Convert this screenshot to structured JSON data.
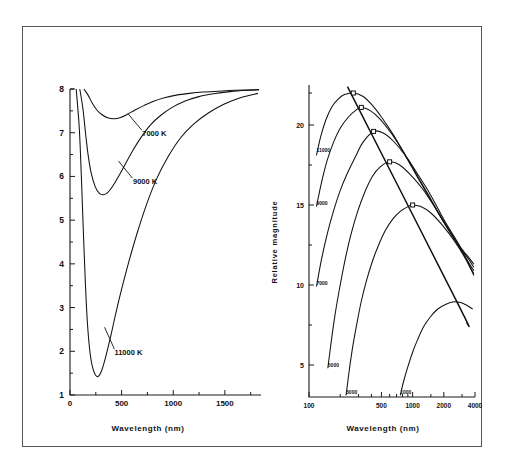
{
  "figure": {
    "border_color": "#555555",
    "background": "#ffffff"
  },
  "chart_data": [
    {
      "panel": "left",
      "type": "line",
      "title": "",
      "xlabel": "Wavelength (nm)",
      "ylabel": "",
      "xlim": [
        0,
        1850
      ],
      "ylim": [
        8,
        1
      ],
      "y_inverted": true,
      "x_scale": "linear",
      "y_scale": "linear",
      "grid": false,
      "xticks": [
        0,
        500,
        1000,
        1500
      ],
      "xtick_labels": [
        "0",
        "500",
        "1000",
        "1500"
      ],
      "x_minor_ticks": [
        250,
        750,
        1250,
        1750
      ],
      "yticks": [
        1,
        2,
        3,
        4,
        5,
        6,
        7,
        8
      ],
      "ytick_labels": [
        "1",
        "2",
        "3",
        "4",
        "5",
        "6",
        "7",
        "8"
      ],
      "y_minor_ticks": [
        1.5,
        2.5,
        3.5,
        4.5,
        5.5,
        6.5,
        7.5
      ],
      "legend_position": "inline-annotations",
      "series": [
        {
          "name": "11000 K",
          "label": "11000 K",
          "temperature_k": 11000,
          "peak_wavelength_nm": 264,
          "peak_magnitude": 1.42,
          "label_xy": [
            430,
            1.92
          ],
          "leader_from": [
            430,
            2.05
          ],
          "leader_to": [
            335,
            2.55
          ],
          "points": [
            [
              60,
              8.0
            ],
            [
              90,
              7.1
            ],
            [
              110,
              6.0
            ],
            [
              130,
              4.7
            ],
            [
              150,
              3.5
            ],
            [
              170,
              2.6
            ],
            [
              195,
              1.95
            ],
            [
              225,
              1.58
            ],
            [
              264,
              1.42
            ],
            [
              300,
              1.52
            ],
            [
              340,
              1.82
            ],
            [
              390,
              2.3
            ],
            [
              440,
              2.83
            ],
            [
              500,
              3.42
            ],
            [
              570,
              4.05
            ],
            [
              650,
              4.7
            ],
            [
              740,
              5.35
            ],
            [
              840,
              5.95
            ],
            [
              950,
              6.45
            ],
            [
              1070,
              6.88
            ],
            [
              1200,
              7.2
            ],
            [
              1340,
              7.45
            ],
            [
              1490,
              7.65
            ],
            [
              1650,
              7.8
            ],
            [
              1820,
              7.9
            ]
          ]
        },
        {
          "name": "9000 K",
          "label": "9000 K",
          "temperature_k": 9000,
          "peak_wavelength_nm": 322,
          "peak_magnitude": 5.58,
          "label_xy": [
            610,
            5.82
          ],
          "leader_from": [
            605,
            5.96
          ],
          "leader_to": [
            470,
            6.35
          ],
          "points": [
            [
              95,
              8.0
            ],
            [
              125,
              7.55
            ],
            [
              150,
              7.0
            ],
            [
              175,
              6.5
            ],
            [
              205,
              6.08
            ],
            [
              245,
              5.76
            ],
            [
              285,
              5.61
            ],
            [
              322,
              5.58
            ],
            [
              365,
              5.63
            ],
            [
              415,
              5.78
            ],
            [
              470,
              6.0
            ],
            [
              535,
              6.28
            ],
            [
              610,
              6.6
            ],
            [
              690,
              6.9
            ],
            [
              780,
              7.18
            ],
            [
              880,
              7.4
            ],
            [
              990,
              7.58
            ],
            [
              1110,
              7.72
            ],
            [
              1240,
              7.82
            ],
            [
              1390,
              7.89
            ],
            [
              1550,
              7.94
            ],
            [
              1720,
              7.97
            ],
            [
              1830,
              7.98
            ]
          ]
        },
        {
          "name": "7000 K",
          "label": "7000 K",
          "temperature_k": 7000,
          "peak_wavelength_nm": 428,
          "peak_magnitude": 7.32,
          "label_xy": [
            700,
            6.92
          ],
          "leader_from": [
            695,
            7.06
          ],
          "leader_to": [
            560,
            7.44
          ],
          "points": [
            [
              135,
              8.0
            ],
            [
              175,
              7.86
            ],
            [
              215,
              7.68
            ],
            [
              260,
              7.52
            ],
            [
              310,
              7.41
            ],
            [
              365,
              7.34
            ],
            [
              428,
              7.32
            ],
            [
              490,
              7.35
            ],
            [
              555,
              7.42
            ],
            [
              630,
              7.52
            ],
            [
              715,
              7.62
            ],
            [
              810,
              7.72
            ],
            [
              915,
              7.8
            ],
            [
              1030,
              7.86
            ],
            [
              1155,
              7.9
            ],
            [
              1290,
              7.93
            ],
            [
              1440,
              7.95
            ],
            [
              1600,
              7.97
            ],
            [
              1830,
              7.99
            ]
          ]
        }
      ]
    },
    {
      "panel": "right",
      "type": "line",
      "title": "",
      "xlabel": "Wavelength (nm)",
      "ylabel": "Relative magnitude",
      "xlim": [
        100,
        4000
      ],
      "ylim": [
        3.0,
        22.5
      ],
      "x_scale": "log",
      "y_scale": "linear",
      "grid": false,
      "xticks": [
        100,
        500,
        1000,
        2000,
        4000
      ],
      "xtick_labels": [
        "100",
        "500",
        "1000",
        "2000",
        "4000"
      ],
      "x_minor_ticks": [
        200,
        300,
        400,
        600,
        700,
        800,
        900,
        1500,
        3000
      ],
      "yticks": [
        5,
        10,
        15,
        20
      ],
      "ytick_labels": [
        "5",
        "10",
        "15",
        "20"
      ],
      "y_minor_ticks": [
        7.5,
        12.5,
        17.5,
        22
      ],
      "legend_position": "inline-labels-left",
      "wien_line": {
        "name": "Wien displacement line",
        "points": [
          [
            235,
            22.4
          ],
          [
            2700,
            8.9
          ],
          [
            3350,
            7.6
          ]
        ],
        "peak_markers": [
          {
            "x": 268,
            "y": 22.0,
            "temperature_k": 11000
          },
          {
            "x": 320,
            "y": 21.1,
            "temperature_k": 9000
          },
          {
            "x": 420,
            "y": 19.6,
            "temperature_k": 7000
          },
          {
            "x": 600,
            "y": 17.7,
            "temperature_k": 5000
          },
          {
            "x": 1000,
            "y": 15.0,
            "temperature_k": 3000
          }
        ]
      },
      "series": [
        {
          "name": "11000",
          "label": "11000",
          "temperature_k": 11000,
          "label_xy": [
            118,
            18.3
          ],
          "peak_xy": [
            268,
            22.0
          ],
          "points": [
            [
              118,
              18.1
            ],
            [
              130,
              19.3
            ],
            [
              145,
              20.3
            ],
            [
              165,
              21.1
            ],
            [
              190,
              21.6
            ],
            [
              220,
              21.9
            ],
            [
              268,
              22.0
            ],
            [
              330,
              21.8
            ],
            [
              400,
              21.3
            ],
            [
              500,
              20.5
            ],
            [
              650,
              19.4
            ],
            [
              850,
              18.1
            ],
            [
              1100,
              16.8
            ],
            [
              1500,
              15.3
            ],
            [
              2000,
              13.9
            ],
            [
              2700,
              12.6
            ],
            [
              3400,
              11.8
            ],
            [
              3900,
              11.3
            ]
          ]
        },
        {
          "name": "9000",
          "label": "9000",
          "temperature_k": 9000,
          "label_xy": [
            118,
            15.0
          ],
          "peak_xy": [
            320,
            21.1
          ],
          "points": [
            [
              118,
              14.9
            ],
            [
              132,
              16.4
            ],
            [
              150,
              17.8
            ],
            [
              172,
              18.9
            ],
            [
              200,
              19.8
            ],
            [
              240,
              20.5
            ],
            [
              280,
              20.9
            ],
            [
              320,
              21.1
            ],
            [
              390,
              20.9
            ],
            [
              480,
              20.4
            ],
            [
              620,
              19.5
            ],
            [
              800,
              18.4
            ],
            [
              1050,
              17.1
            ],
            [
              1400,
              15.7
            ],
            [
              1900,
              14.2
            ],
            [
              2600,
              12.8
            ],
            [
              3400,
              11.7
            ],
            [
              3900,
              11.1
            ]
          ]
        },
        {
          "name": "7000",
          "label": "7000",
          "temperature_k": 7000,
          "label_xy": [
            118,
            10.0
          ],
          "peak_xy": [
            420,
            19.6
          ],
          "points": [
            [
              118,
              9.9
            ],
            [
              132,
              11.6
            ],
            [
              150,
              13.2
            ],
            [
              172,
              14.6
            ],
            [
              200,
              15.9
            ],
            [
              235,
              17.0
            ],
            [
              280,
              18.0
            ],
            [
              330,
              18.9
            ],
            [
              420,
              19.6
            ],
            [
              520,
              19.5
            ],
            [
              650,
              19.0
            ],
            [
              850,
              18.1
            ],
            [
              1100,
              17.0
            ],
            [
              1500,
              15.6
            ],
            [
              2000,
              14.1
            ],
            [
              2700,
              12.7
            ],
            [
              3400,
              11.5
            ],
            [
              3900,
              10.9
            ]
          ]
        },
        {
          "name": "5000",
          "label": "5000",
          "temperature_k": 5000,
          "label_xy": [
            152,
            4.9
          ],
          "peak_xy": [
            600,
            17.7
          ],
          "points": [
            [
              152,
              4.8
            ],
            [
              165,
              6.6
            ],
            [
              180,
              8.3
            ],
            [
              200,
              10.0
            ],
            [
              225,
              11.7
            ],
            [
              255,
              13.2
            ],
            [
              295,
              14.6
            ],
            [
              345,
              15.8
            ],
            [
              410,
              16.8
            ],
            [
              490,
              17.4
            ],
            [
              600,
              17.7
            ],
            [
              750,
              17.5
            ],
            [
              950,
              16.9
            ],
            [
              1250,
              16.0
            ],
            [
              1700,
              14.7
            ],
            [
              2300,
              13.3
            ],
            [
              3100,
              11.9
            ],
            [
              3900,
              10.7
            ]
          ]
        },
        {
          "name": "3000",
          "label": "3000",
          "temperature_k": 3000,
          "label_xy": [
            228,
            3.2
          ],
          "peak_xy": [
            1000,
            15.0
          ],
          "points": [
            [
              228,
              3.1
            ],
            [
              245,
              4.7
            ],
            [
              265,
              6.2
            ],
            [
              290,
              7.6
            ],
            [
              320,
              9.0
            ],
            [
              360,
              10.3
            ],
            [
              410,
              11.5
            ],
            [
              470,
              12.5
            ],
            [
              545,
              13.4
            ],
            [
              640,
              14.1
            ],
            [
              760,
              14.6
            ],
            [
              900,
              14.9
            ],
            [
              1000,
              15.0
            ],
            [
              1200,
              14.9
            ],
            [
              1500,
              14.5
            ],
            [
              1900,
              13.8
            ],
            [
              2500,
              12.8
            ],
            [
              3200,
              11.7
            ],
            [
              3900,
              10.6
            ]
          ]
        },
        {
          "name": "1000",
          "label": "1000",
          "temperature_k": 1000,
          "label_xy": [
            760,
            3.2
          ],
          "peak_xy": [
            2700,
            8.9
          ],
          "points": [
            [
              760,
              3.1
            ],
            [
              820,
              4.0
            ],
            [
              900,
              4.9
            ],
            [
              1000,
              5.8
            ],
            [
              1120,
              6.6
            ],
            [
              1280,
              7.4
            ],
            [
              1480,
              8.0
            ],
            [
              1750,
              8.5
            ],
            [
              2100,
              8.8
            ],
            [
              2500,
              8.95
            ],
            [
              2900,
              8.9
            ],
            [
              3300,
              8.75
            ],
            [
              3800,
              8.5
            ]
          ]
        }
      ]
    }
  ]
}
